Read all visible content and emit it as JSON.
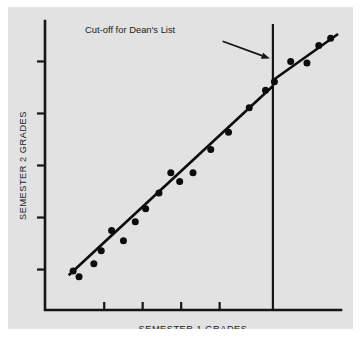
{
  "figure": {
    "background_color": "#ffffff",
    "panel_color": "#e2e2e2",
    "ink_color": "#151515"
  },
  "chart_data": {
    "type": "scatter",
    "title": "",
    "subtitle": "",
    "xlabel": "SEMESTER 1 GRADES",
    "ylabel": "SEMESTER 2 GRADES",
    "grid": false,
    "legend": "none",
    "xlim": [
      0,
      100
    ],
    "ylim": [
      0,
      100
    ],
    "x_tick_labels": [
      "",
      "",
      "",
      ""
    ],
    "y_tick_labels": [
      "",
      "",
      "",
      "",
      ""
    ],
    "x_ticks": [
      20,
      33,
      46,
      59
    ],
    "y_ticks": [
      14,
      32,
      50,
      68,
      86
    ],
    "annotations": [
      {
        "name": "cutoff-annotation",
        "text": "Cut-off for Dean's List",
        "text_x": 44,
        "text_y": 96,
        "arrow_from_x": 60,
        "arrow_from_y": 93,
        "arrow_to_x": 76,
        "arrow_to_y": 87
      }
    ],
    "reference_lines": [
      {
        "name": "dean-list-cutoff",
        "orientation": "vertical",
        "x": 77,
        "y_start": 0,
        "y_end": 99
      }
    ],
    "series": [
      {
        "name": "Below cut-off",
        "marker": "filled-circle",
        "color": "#0c0c0c",
        "points": [
          {
            "x": 9.5,
            "y": 13.5
          },
          {
            "x": 11.5,
            "y": 11.5
          },
          {
            "x": 16.5,
            "y": 16.0
          },
          {
            "x": 19.0,
            "y": 20.5
          },
          {
            "x": 22.5,
            "y": 27.5
          },
          {
            "x": 26.5,
            "y": 24.0
          },
          {
            "x": 30.5,
            "y": 30.5
          },
          {
            "x": 34.0,
            "y": 35.0
          },
          {
            "x": 38.5,
            "y": 40.5
          },
          {
            "x": 42.5,
            "y": 47.5
          },
          {
            "x": 45.5,
            "y": 44.5
          },
          {
            "x": 50.0,
            "y": 47.5
          },
          {
            "x": 56.0,
            "y": 55.5
          },
          {
            "x": 62.0,
            "y": 61.5
          },
          {
            "x": 69.0,
            "y": 70.0
          },
          {
            "x": 74.5,
            "y": 76.0
          }
        ]
      },
      {
        "name": "Above cut-off",
        "marker": "filled-circle",
        "color": "#0c0c0c",
        "points": [
          {
            "x": 77.5,
            "y": 79.0
          },
          {
            "x": 83.0,
            "y": 86.0
          },
          {
            "x": 88.5,
            "y": 85.5
          },
          {
            "x": 92.5,
            "y": 91.5
          },
          {
            "x": 96.5,
            "y": 94.0
          }
        ]
      }
    ],
    "fit_lines": [
      {
        "name": "regression-below-cutoff",
        "x_start": 8.0,
        "y_start": 12.0,
        "x_end": 77.0,
        "y_end": 77.5
      },
      {
        "name": "regression-above-cutoff",
        "x_start": 77.0,
        "y_start": 79.5,
        "x_end": 99.0,
        "y_end": 95.5
      }
    ]
  }
}
